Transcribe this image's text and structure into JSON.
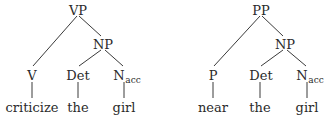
{
  "trees": [
    {
      "root": "VP",
      "phrase": "NP",
      "head": "V",
      "det": "Det",
      "noun": "N",
      "noun_sub": "acc",
      "words": [
        "criticize",
        "the",
        "girl"
      ]
    },
    {
      "root": "PP",
      "phrase": "NP",
      "head": "P",
      "det": "Det",
      "noun": "N",
      "noun_sub": "acc",
      "words": [
        "near",
        "the",
        "girl"
      ]
    }
  ]
}
